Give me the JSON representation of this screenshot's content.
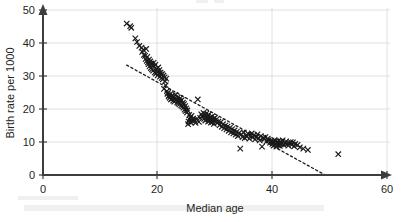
{
  "chart_data": {
    "type": "scatter",
    "title": "",
    "subtitle": "",
    "xlabel": "Median age",
    "ylabel": "Birth rate per 1000",
    "xlim": [
      0,
      60
    ],
    "ylim": [
      0,
      50
    ],
    "xticks": [
      0,
      20,
      40,
      60
    ],
    "yticks": [
      0,
      10,
      20,
      30,
      40,
      50
    ],
    "xtick_labels": [
      "0",
      "20",
      "40",
      "60"
    ],
    "ytick_labels": [
      "0",
      "10",
      "20",
      "30",
      "40",
      "50"
    ],
    "grid": true,
    "grid_axis": "both",
    "legend": false,
    "legend_position": "none",
    "marker": "x",
    "marker_color": "#1a1a1a",
    "axis_color": "#3d3d3f",
    "grid_color": "#d6d8da",
    "background_color": "#ffffff",
    "annotations": [
      {
        "kind": "trendline",
        "style": "dashed",
        "x_start": 14.6,
        "y_start": 33.3,
        "x_end": 49.2,
        "y_end": 0.0,
        "color": "#1a1a1a"
      }
    ],
    "series": [
      {
        "name": "Countries",
        "marker": "x",
        "color": "#1a1a1a",
        "points": [
          [
            14.6,
            45.9
          ],
          [
            15.2,
            45.1
          ],
          [
            15.4,
            44.6
          ],
          [
            16.1,
            41.4
          ],
          [
            16.4,
            40.3
          ],
          [
            16.8,
            39.1
          ],
          [
            17.2,
            38.6
          ],
          [
            17.3,
            37.3
          ],
          [
            17.5,
            37.9
          ],
          [
            17.6,
            36.4
          ],
          [
            17.8,
            36.1
          ],
          [
            17.9,
            35.2
          ],
          [
            18.0,
            38.2
          ],
          [
            18.1,
            34.6
          ],
          [
            18.2,
            35.8
          ],
          [
            18.3,
            34.1
          ],
          [
            18.4,
            33.6
          ],
          [
            18.5,
            35.0
          ],
          [
            18.6,
            33.0
          ],
          [
            18.7,
            34.4
          ],
          [
            18.8,
            32.4
          ],
          [
            18.9,
            33.8
          ],
          [
            19.0,
            32.0
          ],
          [
            19.1,
            33.2
          ],
          [
            19.2,
            31.6
          ],
          [
            19.3,
            34.0
          ],
          [
            19.4,
            32.8
          ],
          [
            19.5,
            31.1
          ],
          [
            19.6,
            33.4
          ],
          [
            19.7,
            30.7
          ],
          [
            19.8,
            32.2
          ],
          [
            19.9,
            31.3
          ],
          [
            20.0,
            30.2
          ],
          [
            20.1,
            32.6
          ],
          [
            20.2,
            30.9
          ],
          [
            20.3,
            31.8
          ],
          [
            20.4,
            29.8
          ],
          [
            20.5,
            31.0
          ],
          [
            20.6,
            30.4
          ],
          [
            20.7,
            29.4
          ],
          [
            20.8,
            30.6
          ],
          [
            20.9,
            29.0
          ],
          [
            21.0,
            30.1
          ],
          [
            21.1,
            26.1
          ],
          [
            21.2,
            29.6
          ],
          [
            21.3,
            28.4
          ],
          [
            21.4,
            27.2
          ],
          [
            21.5,
            29.2
          ],
          [
            21.6,
            25.4
          ],
          [
            21.7,
            24.6
          ],
          [
            21.8,
            24.9
          ],
          [
            21.9,
            23.8
          ],
          [
            22.0,
            24.2
          ],
          [
            22.1,
            23.4
          ],
          [
            22.2,
            24.5
          ],
          [
            22.3,
            22.9
          ],
          [
            22.4,
            23.9
          ],
          [
            22.5,
            23.1
          ],
          [
            22.6,
            24.1
          ],
          [
            22.7,
            22.5
          ],
          [
            22.8,
            23.6
          ],
          [
            22.9,
            22.2
          ],
          [
            23.0,
            23.3
          ],
          [
            23.1,
            24.3
          ],
          [
            23.2,
            22.8
          ],
          [
            23.3,
            23.0
          ],
          [
            23.4,
            22.0
          ],
          [
            23.5,
            23.5
          ],
          [
            23.6,
            21.7
          ],
          [
            23.7,
            22.6
          ],
          [
            23.8,
            21.4
          ],
          [
            23.9,
            23.2
          ],
          [
            24.0,
            22.4
          ],
          [
            24.1,
            21.1
          ],
          [
            24.2,
            22.7
          ],
          [
            24.3,
            20.8
          ],
          [
            24.4,
            21.9
          ],
          [
            24.5,
            20.4
          ],
          [
            24.6,
            21.5
          ],
          [
            24.7,
            19.8
          ],
          [
            24.8,
            20.9
          ],
          [
            24.9,
            19.4
          ],
          [
            25.0,
            20.2
          ],
          [
            25.1,
            18.9
          ],
          [
            25.2,
            19.6
          ],
          [
            25.3,
            15.4
          ],
          [
            25.4,
            16.2
          ],
          [
            25.5,
            18.2
          ],
          [
            25.6,
            16.8
          ],
          [
            25.7,
            17.4
          ],
          [
            25.8,
            15.9
          ],
          [
            25.9,
            17.9
          ],
          [
            26.0,
            16.4
          ],
          [
            26.2,
            17.1
          ],
          [
            26.4,
            16.6
          ],
          [
            26.6,
            15.8
          ],
          [
            26.8,
            16.9
          ],
          [
            27.0,
            22.9
          ],
          [
            27.2,
            16.1
          ],
          [
            27.4,
            17.3
          ],
          [
            27.6,
            18.4
          ],
          [
            27.8,
            17.7
          ],
          [
            28.0,
            18.8
          ],
          [
            28.1,
            17.0
          ],
          [
            28.2,
            18.1
          ],
          [
            28.3,
            16.5
          ],
          [
            28.4,
            17.6
          ],
          [
            28.5,
            18.6
          ],
          [
            28.6,
            16.9
          ],
          [
            28.7,
            17.9
          ],
          [
            28.8,
            16.2
          ],
          [
            28.9,
            18.3
          ],
          [
            29.0,
            17.2
          ],
          [
            29.1,
            16.6
          ],
          [
            29.2,
            17.5
          ],
          [
            29.3,
            15.9
          ],
          [
            29.4,
            16.8
          ],
          [
            29.5,
            17.8
          ],
          [
            29.6,
            16.1
          ],
          [
            29.7,
            17.0
          ],
          [
            29.8,
            15.5
          ],
          [
            29.9,
            16.4
          ],
          [
            30.0,
            17.3
          ],
          [
            30.2,
            16.7
          ],
          [
            30.4,
            15.8
          ],
          [
            30.6,
            16.2
          ],
          [
            30.8,
            15.1
          ],
          [
            31.0,
            16.0
          ],
          [
            31.2,
            14.6
          ],
          [
            31.4,
            15.4
          ],
          [
            31.6,
            14.2
          ],
          [
            31.8,
            15.0
          ],
          [
            32.0,
            13.8
          ],
          [
            32.2,
            14.7
          ],
          [
            32.4,
            13.4
          ],
          [
            32.6,
            14.3
          ],
          [
            32.8,
            12.9
          ],
          [
            33.0,
            13.9
          ],
          [
            33.2,
            12.6
          ],
          [
            33.4,
            13.5
          ],
          [
            33.6,
            12.2
          ],
          [
            33.8,
            13.1
          ],
          [
            34.0,
            11.8
          ],
          [
            34.2,
            12.7
          ],
          [
            34.4,
            8.0
          ],
          [
            34.6,
            12.3
          ],
          [
            34.8,
            11.5
          ],
          [
            35.0,
            12.9
          ],
          [
            35.2,
            11.2
          ],
          [
            35.4,
            12.0
          ],
          [
            35.6,
            11.7
          ],
          [
            35.8,
            12.4
          ],
          [
            36.0,
            11.0
          ],
          [
            36.2,
            11.9
          ],
          [
            36.4,
            12.6
          ],
          [
            36.6,
            11.4
          ],
          [
            36.8,
            12.1
          ],
          [
            37.0,
            10.8
          ],
          [
            37.2,
            11.6
          ],
          [
            37.4,
            12.3
          ],
          [
            37.6,
            11.1
          ],
          [
            37.8,
            10.5
          ],
          [
            38.0,
            11.8
          ],
          [
            38.2,
            8.6
          ],
          [
            38.4,
            11.3
          ],
          [
            38.6,
            10.9
          ],
          [
            38.8,
            11.5
          ],
          [
            39.0,
            10.2
          ],
          [
            39.2,
            11.0
          ],
          [
            39.4,
            10.6
          ],
          [
            39.6,
            9.8
          ],
          [
            39.8,
            10.4
          ],
          [
            40.0,
            9.4
          ],
          [
            40.1,
            10.1
          ],
          [
            40.2,
            8.9
          ],
          [
            40.3,
            9.9
          ],
          [
            40.4,
            10.6
          ],
          [
            40.5,
            9.2
          ],
          [
            40.6,
            10.3
          ],
          [
            40.7,
            8.6
          ],
          [
            40.8,
            9.7
          ],
          [
            40.9,
            10.0
          ],
          [
            41.0,
            9.0
          ],
          [
            41.1,
            10.4
          ],
          [
            41.2,
            9.5
          ],
          [
            41.3,
            8.8
          ],
          [
            41.4,
            10.1
          ],
          [
            41.5,
            9.3
          ],
          [
            41.6,
            9.8
          ],
          [
            41.8,
            10.5
          ],
          [
            42.0,
            9.1
          ],
          [
            42.2,
            9.6
          ],
          [
            42.4,
            10.2
          ],
          [
            42.6,
            9.4
          ],
          [
            42.8,
            8.9
          ],
          [
            43.0,
            9.7
          ],
          [
            43.2,
            10.0
          ],
          [
            43.4,
            9.2
          ],
          [
            43.6,
            9.9
          ],
          [
            43.8,
            8.7
          ],
          [
            44.0,
            9.4
          ],
          [
            44.4,
            9.1
          ],
          [
            44.8,
            8.4
          ],
          [
            45.4,
            8.0
          ],
          [
            46.2,
            7.6
          ],
          [
            51.5,
            6.3
          ]
        ]
      }
    ]
  },
  "axes": {
    "y_axis_label": "Birth rate per 1000",
    "x_axis_label": "Median age"
  }
}
